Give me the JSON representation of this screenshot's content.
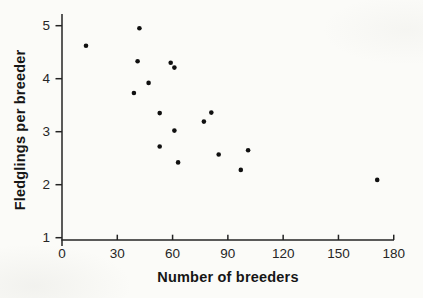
{
  "figure": {
    "background": "#fbfbf8"
  },
  "chart_data": {
    "type": "scatter",
    "title": "",
    "xlabel": "Number of breeders",
    "ylabel": "Fledglings per breeder",
    "xlim": [
      0,
      180
    ],
    "ylim": [
      1,
      5
    ],
    "x_ticks": [
      0,
      30,
      60,
      90,
      120,
      150,
      180
    ],
    "y_ticks": [
      1,
      2,
      3,
      4,
      5
    ],
    "grid": false,
    "legend": "none",
    "marker": {
      "shape": "filled-circle",
      "color": "#101010",
      "radius_px": 2.3
    },
    "axis_color": "#242424",
    "text_color": "#262626",
    "points": [
      [
        13,
        4.62
      ],
      [
        42,
        4.95
      ],
      [
        41,
        4.33
      ],
      [
        59,
        4.3
      ],
      [
        61,
        4.21
      ],
      [
        47,
        3.92
      ],
      [
        39,
        3.73
      ],
      [
        53,
        3.35
      ],
      [
        81,
        3.36
      ],
      [
        77,
        3.19
      ],
      [
        61,
        3.02
      ],
      [
        53,
        2.72
      ],
      [
        101,
        2.65
      ],
      [
        85,
        2.57
      ],
      [
        63,
        2.42
      ],
      [
        97,
        2.28
      ],
      [
        171,
        2.09
      ]
    ]
  }
}
